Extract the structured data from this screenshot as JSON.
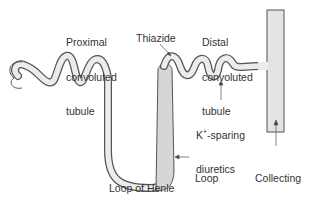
{
  "diagram": {
    "labels": {
      "proximal": [
        "Proximal",
        "convoluted",
        "tubule"
      ],
      "thiazide": "Thiazide",
      "distal": [
        "Distal",
        "convoluted",
        "tubule"
      ],
      "k_sparing_k": "K",
      "k_sparing_sup": "+",
      "k_sparing_rest": "-sparing",
      "k_sparing_line2": "diuretics",
      "loop_diuretics": [
        "Loop",
        "diuretics"
      ],
      "collecting": [
        "Collecting",
        "tubule"
      ],
      "loop_of_henle": "Loop of Henle"
    },
    "colors": {
      "tubule_fill": "#e8e8e8",
      "highlight_fill": "#d4d4d4",
      "outline": "#555555",
      "text": "#333333"
    }
  }
}
